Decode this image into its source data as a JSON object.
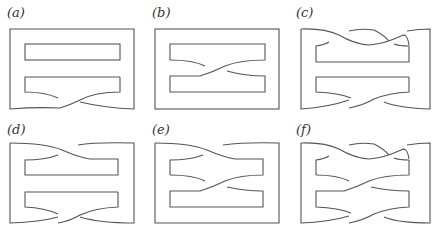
{
  "figure": {
    "panels": [
      {
        "id": "a",
        "label": "(a)",
        "top_crossings": 0,
        "middle_crossings": 0,
        "bottom_crossings": 1
      },
      {
        "id": "b",
        "label": "(b)",
        "top_crossings": 0,
        "middle_crossings": 1,
        "bottom_crossings": 0
      },
      {
        "id": "c",
        "label": "(c)",
        "top_crossings": 2,
        "middle_crossings": 0,
        "bottom_crossings": 1
      },
      {
        "id": "d",
        "label": "(d)",
        "top_crossings": 1,
        "middle_crossings": 0,
        "bottom_crossings": 1
      },
      {
        "id": "e",
        "label": "(e)",
        "top_crossings": 1,
        "middle_crossings": 1,
        "bottom_crossings": 0
      },
      {
        "id": "f",
        "label": "(f)",
        "top_crossings": 2,
        "middle_crossings": 1,
        "bottom_crossings": 1
      }
    ],
    "stroke_color": "#555555",
    "background": "#ffffff"
  }
}
